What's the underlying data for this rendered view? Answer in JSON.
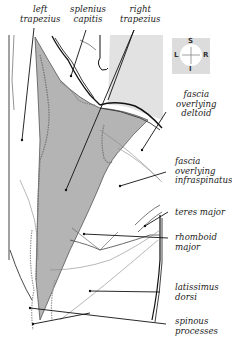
{
  "figure": {
    "labels": {
      "left_trapezius": "left\ntrapezius",
      "splenius_capitis": "splenius\ncapitis",
      "right_trapezius": "right\ntrapezius",
      "fascia_deltoid": "fascia\noverlying\ndeltoid",
      "fascia_infraspinatus": "fascia\noverlying\ninfraspinatus",
      "teres_major": "teres major",
      "rhomboid_major": "rhomboid\nmajor",
      "latissimus_dorsi": "latissimus\ndorsi",
      "spinous_processes": "spinous\nprocesses"
    },
    "compass": {
      "superior": "S",
      "inferior": "I",
      "left": "L",
      "right": "R"
    },
    "colors": {
      "muscle_fill": "#b4b4b4",
      "background_panel": "#e2e2e2",
      "line": "#111111",
      "thin_line": "#888888"
    }
  }
}
